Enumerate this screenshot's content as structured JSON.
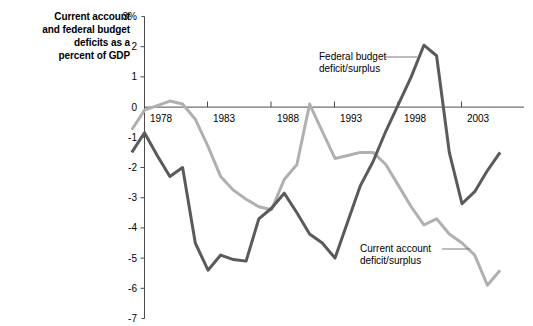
{
  "chart_data": {
    "type": "line",
    "title": "Current account\nand federal budget\ndeficits as a\npercent of GDP",
    "xlabel": "",
    "ylabel": "",
    "ylim": [
      -7,
      3
    ],
    "xlim": [
      1977,
      2006
    ],
    "grid": false,
    "legend_position": "inline-annotations",
    "y_ticks": [
      "3%",
      "2",
      "1",
      "0",
      "-1",
      "-2",
      "-3",
      "-4",
      "-5",
      "-6",
      "-7"
    ],
    "y_tick_values": [
      3,
      2,
      1,
      0,
      -1,
      -2,
      -3,
      -4,
      -5,
      -6,
      -7
    ],
    "x_ticks": [
      "1978",
      "1983",
      "1988",
      "1993",
      "1998",
      "2003"
    ],
    "x_tick_values": [
      1978,
      1983,
      1988,
      1993,
      1998,
      2003
    ],
    "annotations": [
      {
        "text": "Federal budget\ndeficit/surplus",
        "line1": "Federal budget",
        "line2": "deficit/surplus",
        "target_series": "Federal budget deficit/surplus"
      },
      {
        "text": "Current account\ndeficit/surplus",
        "line1": "Current account",
        "line2": "deficit/surplus",
        "target_series": "Current account deficit/surplus"
      }
    ],
    "x": [
      1977,
      1978,
      1979,
      1980,
      1981,
      1982,
      1983,
      1984,
      1985,
      1986,
      1987,
      1988,
      1989,
      1990,
      1991,
      1992,
      1993,
      1994,
      1995,
      1996,
      1997,
      1998,
      1999,
      2000,
      2001,
      2002,
      2003,
      2004,
      2005,
      2006
    ],
    "series": [
      {
        "name": "Federal budget deficit/surplus",
        "color": "#5a5a5a",
        "values": [
          -1.5,
          -0.85,
          -1.6,
          -2.3,
          -2.0,
          -4.5,
          -5.4,
          -4.9,
          -5.05,
          -5.1,
          -3.7,
          -3.35,
          -2.85,
          -3.5,
          -4.2,
          -4.5,
          -5.0,
          -3.8,
          -2.6,
          -1.8,
          -0.8,
          0.1,
          1.0,
          2.05,
          1.7,
          -1.5,
          -3.2,
          -2.8,
          -2.1,
          -1.5
        ]
      },
      {
        "name": "Current account deficit/surplus",
        "color": "#b0b0b0",
        "values": [
          -0.75,
          -0.1,
          0.05,
          0.2,
          0.1,
          -0.4,
          -1.3,
          -2.3,
          -2.75,
          -3.05,
          -3.3,
          -3.4,
          -2.4,
          -1.9,
          0.1,
          -0.8,
          -1.7,
          -1.6,
          -1.5,
          -1.5,
          -1.9,
          -2.6,
          -3.3,
          -3.9,
          -3.7,
          -4.2,
          -4.5,
          -4.9,
          -5.9,
          -5.4
        ]
      }
    ]
  },
  "annotation_texts": {
    "federal_line1": "Federal budget",
    "federal_line2": "deficit/surplus",
    "current_line1": "Current account",
    "current_line2": "deficit/surplus"
  },
  "axis": {
    "y_labels": [
      "3%",
      "2",
      "1",
      "0",
      "-1",
      "-2",
      "-3",
      "-4",
      "-5",
      "-6",
      "-7"
    ],
    "x_labels": [
      "1978",
      "1983",
      "1988",
      "1993",
      "1998",
      "2003"
    ]
  },
  "colors": {
    "federal": "#5a5a5a",
    "current": "#b0b0b0",
    "axis": "#4a4a4a",
    "background": "#ffffff"
  }
}
